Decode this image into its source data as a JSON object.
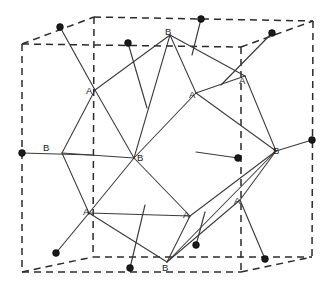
{
  "figure": {
    "width": 331,
    "height": 287,
    "background_color": "#ffffff",
    "line_color": "#3a3a3a",
    "dash_color": "#2b2b2b",
    "atom_color": "#1a1a1a"
  },
  "unit_cell": {
    "style": "dashed",
    "corners": {
      "top_front_left": [
        22,
        44
      ],
      "top_front_right": [
        241,
        47
      ],
      "top_back_left": [
        94,
        17
      ],
      "top_back_right": [
        313,
        21
      ],
      "bottom_front_left": [
        22,
        272
      ],
      "bottom_front_right": [
        241,
        272
      ],
      "bottom_back_left": [
        93,
        257
      ],
      "bottom_back_right": [
        312,
        257
      ]
    },
    "edges": [
      [
        [
          22,
          44
        ],
        [
          241,
          47
        ]
      ],
      [
        [
          94,
          17
        ],
        [
          313,
          21
        ]
      ],
      [
        [
          22,
          44
        ],
        [
          94,
          17
        ]
      ],
      [
        [
          241,
          47
        ],
        [
          313,
          21
        ]
      ],
      [
        [
          22,
          272
        ],
        [
          241,
          272
        ]
      ],
      [
        [
          93,
          257
        ],
        [
          312,
          257
        ]
      ],
      [
        [
          22,
          272
        ],
        [
          93,
          257
        ]
      ],
      [
        [
          241,
          272
        ],
        [
          312,
          257
        ]
      ],
      [
        [
          22,
          44
        ],
        [
          22,
          272
        ]
      ],
      [
        [
          241,
          47
        ],
        [
          241,
          272
        ]
      ],
      [
        [
          313,
          21
        ],
        [
          312,
          257
        ]
      ],
      [
        [
          94,
          17
        ],
        [
          93,
          257
        ]
      ]
    ]
  },
  "polyhedron": {
    "vertices": {
      "B_top": [
        170,
        35
      ],
      "B_left": [
        62,
        153
      ],
      "B_right": [
        276,
        151
      ],
      "B_bottom": [
        167,
        262
      ],
      "B_center": [
        134,
        158
      ],
      "A_upper_left": [
        95,
        90
      ],
      "A_upper_mid": [
        196,
        93
      ],
      "A_upper_right": [
        245,
        76
      ],
      "A_lower_left": [
        89,
        213
      ],
      "A_lower_mid": [
        190,
        216
      ],
      "A_lower_right": [
        240,
        200
      ]
    },
    "edges": [
      [
        [
          170,
          35
        ],
        [
          95,
          90
        ]
      ],
      [
        [
          170,
          35
        ],
        [
          196,
          93
        ]
      ],
      [
        [
          170,
          35
        ],
        [
          245,
          76
        ]
      ],
      [
        [
          170,
          35
        ],
        [
          134,
          158
        ]
      ],
      [
        [
          95,
          90
        ],
        [
          62,
          153
        ]
      ],
      [
        [
          95,
          90
        ],
        [
          134,
          158
        ]
      ],
      [
        [
          196,
          93
        ],
        [
          276,
          151
        ]
      ],
      [
        [
          196,
          93
        ],
        [
          134,
          158
        ]
      ],
      [
        [
          245,
          76
        ],
        [
          276,
          151
        ]
      ],
      [
        [
          62,
          153
        ],
        [
          89,
          213
        ]
      ],
      [
        [
          62,
          153
        ],
        [
          134,
          158
        ]
      ],
      [
        [
          276,
          151
        ],
        [
          190,
          216
        ]
      ],
      [
        [
          276,
          151
        ],
        [
          240,
          200
        ]
      ],
      [
        [
          276,
          151
        ],
        [
          167,
          262
        ]
      ],
      [
        [
          134,
          158
        ],
        [
          89,
          213
        ]
      ],
      [
        [
          134,
          158
        ],
        [
          190,
          216
        ]
      ],
      [
        [
          89,
          213
        ],
        [
          167,
          262
        ]
      ],
      [
        [
          190,
          216
        ],
        [
          167,
          262
        ]
      ],
      [
        [
          240,
          200
        ],
        [
          167,
          262
        ]
      ],
      [
        [
          245,
          76
        ],
        [
          196,
          93
        ]
      ],
      [
        [
          89,
          213
        ],
        [
          190,
          216
        ]
      ]
    ]
  },
  "labels": [
    {
      "text": "B",
      "site": "B",
      "position": [
        165,
        27
      ],
      "name": "label-b-top"
    },
    {
      "text": "A",
      "site": "A",
      "position": [
        86,
        86
      ],
      "name": "label-a-upper-left"
    },
    {
      "text": "A",
      "site": "A",
      "position": [
        189,
        90
      ],
      "name": "label-a-upper-mid"
    },
    {
      "text": "A",
      "site": "A",
      "position": [
        239,
        76
      ],
      "name": "label-a-upper-right"
    },
    {
      "text": "B",
      "site": "B",
      "position": [
        43,
        143
      ],
      "name": "label-b-left"
    },
    {
      "text": "B",
      "site": "B",
      "position": [
        137,
        153
      ],
      "name": "label-b-center"
    },
    {
      "text": "B",
      "site": "B",
      "position": [
        273,
        146
      ],
      "name": "label-b-right"
    },
    {
      "text": "A",
      "site": "A",
      "position": [
        83,
        207
      ],
      "name": "label-a-lower-left"
    },
    {
      "text": "A",
      "site": "A",
      "position": [
        183,
        210
      ],
      "name": "label-a-lower-mid"
    },
    {
      "text": "A",
      "site": "A",
      "position": [
        234,
        196
      ],
      "name": "label-a-lower-right"
    },
    {
      "text": "B",
      "site": "B",
      "position": [
        162,
        263
      ],
      "name": "label-b-bottom"
    }
  ],
  "atoms": [
    {
      "name": "atom-top-back-left",
      "position": [
        60,
        27
      ],
      "radius": 3.4
    },
    {
      "name": "atom-top-front-mid",
      "position": [
        128,
        43
      ],
      "radius": 3.4
    },
    {
      "name": "atom-top-back-mid",
      "position": [
        201,
        19
      ],
      "radius": 3.4
    },
    {
      "name": "atom-top-back-right",
      "position": [
        272,
        33
      ],
      "radius": 3.4
    },
    {
      "name": "atom-left-edge-mid",
      "position": [
        22,
        153
      ],
      "radius": 3.4
    },
    {
      "name": "atom-center-right",
      "position": [
        238,
        158
      ],
      "radius": 3.4
    },
    {
      "name": "atom-right-edge-mid",
      "position": [
        312,
        140
      ],
      "radius": 3.4
    },
    {
      "name": "atom-bottom-left",
      "position": [
        56,
        253
      ],
      "radius": 3.4
    },
    {
      "name": "atom-bottom-mid",
      "position": [
        130,
        268
      ],
      "radius": 3.4
    },
    {
      "name": "atom-bottom-back-mid",
      "position": [
        196,
        245
      ],
      "radius": 3.4
    },
    {
      "name": "atom-bottom-right",
      "position": [
        265,
        259
      ],
      "radius": 3.4
    }
  ],
  "bonds": [
    {
      "name": "bond-top-back-left",
      "from": [
        60,
        27
      ],
      "to": [
        95,
        90
      ]
    },
    {
      "name": "bond-top-front-mid",
      "from": [
        128,
        43
      ],
      "to": [
        147,
        108
      ]
    },
    {
      "name": "bond-top-back-mid",
      "from": [
        201,
        19
      ],
      "to": [
        192,
        55
      ]
    },
    {
      "name": "bond-top-back-right",
      "from": [
        272,
        33
      ],
      "to": [
        221,
        85
      ]
    },
    {
      "name": "bond-left-edge-mid",
      "from": [
        22,
        153
      ],
      "to": [
        92,
        155
      ]
    },
    {
      "name": "bond-center-right",
      "from": [
        238,
        158
      ],
      "to": [
        196,
        152
      ]
    },
    {
      "name": "bond-right-edge-mid",
      "from": [
        312,
        140
      ],
      "to": [
        276,
        151
      ]
    },
    {
      "name": "bond-bottom-left",
      "from": [
        56,
        253
      ],
      "to": [
        89,
        213
      ]
    },
    {
      "name": "bond-bottom-mid",
      "from": [
        130,
        268
      ],
      "to": [
        145,
        205
      ]
    },
    {
      "name": "bond-bottom-back-mid",
      "from": [
        196,
        245
      ],
      "to": [
        205,
        212
      ]
    },
    {
      "name": "bond-bottom-right",
      "from": [
        265,
        259
      ],
      "to": [
        240,
        200
      ]
    }
  ]
}
